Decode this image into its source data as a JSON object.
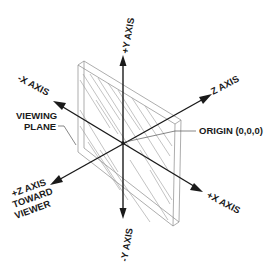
{
  "diagram": {
    "origin_label": "ORIGIN (0,0,0)",
    "viewing_plane_label": [
      "VIEWING",
      "PLANE"
    ],
    "axes": {
      "pos_y": "+Y AXIS",
      "neg_y": "-Y AXIS",
      "neg_x": "-X AXIS",
      "pos_x": "+X AXIS",
      "z": "Z AXIS",
      "pos_z": [
        "+Z AXIS",
        "TOWARD",
        "VIEWER"
      ]
    },
    "colors": {
      "ink": "#1a1a1a",
      "plane_line": "#8a8a8a",
      "background": "#ffffff"
    }
  }
}
